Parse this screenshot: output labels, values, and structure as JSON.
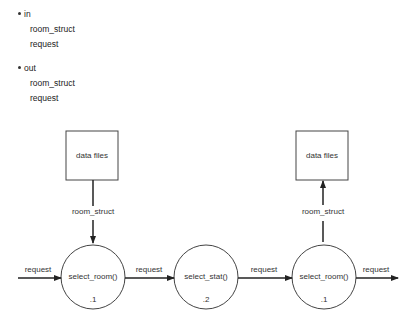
{
  "lists": [
    {
      "label": "in",
      "items": [
        "room_struct",
        "request"
      ]
    },
    {
      "label": "out",
      "items": [
        "room_struct",
        "request"
      ]
    }
  ],
  "diagram": {
    "stores": [
      {
        "label": "data files"
      },
      {
        "label": "data files"
      }
    ],
    "processes": [
      {
        "name": "select_room()",
        "number": ".1"
      },
      {
        "name": "select_stat()",
        "number": ".2"
      },
      {
        "name": "select_room()",
        "number": ".1"
      }
    ],
    "flows": [
      {
        "label": "room_struct",
        "from": "data files",
        "to": "select_room() .1"
      },
      {
        "label": "request",
        "from": "external",
        "to": "select_room() .1"
      },
      {
        "label": "request",
        "from": "select_room() .1",
        "to": "select_stat() .2"
      },
      {
        "label": "request",
        "from": "select_stat() .2",
        "to": "select_room() .1"
      },
      {
        "label": "room_struct",
        "from": "select_room() .1",
        "to": "data files"
      },
      {
        "label": "request",
        "from": "select_room() .1",
        "to": "external"
      }
    ]
  }
}
